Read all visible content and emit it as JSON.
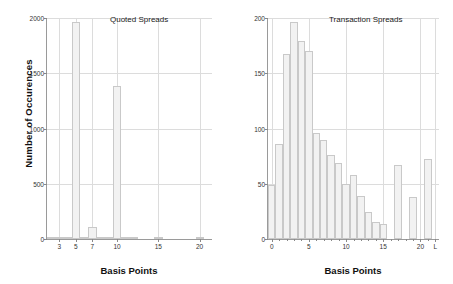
{
  "chart_data": [
    {
      "type": "bar",
      "title": "Quoted Spreads",
      "xlabel": "Basis Points",
      "ylabel": "Number of Occurences",
      "ylim": [
        0,
        2000
      ],
      "xlim": [
        1.5,
        21.5
      ],
      "yticks": [
        0,
        500,
        1000,
        1500,
        2000
      ],
      "ytick_labels": [
        "0",
        "500",
        "1000",
        "1500",
        "2000"
      ],
      "xticks": [
        3,
        5,
        7,
        10,
        15,
        20
      ],
      "xtick_labels": [
        "3",
        "5",
        "7",
        "10",
        "15",
        "20"
      ],
      "grid": true,
      "categories": [
        2,
        3,
        4,
        5,
        6,
        7,
        8,
        9,
        10,
        11,
        12,
        15,
        20
      ],
      "values": [
        8,
        22,
        20,
        1965,
        18,
        105,
        6,
        4,
        1385,
        3,
        2,
        18,
        10
      ],
      "bar_width": 1
    },
    {
      "type": "bar",
      "title": "Transaction Spreads",
      "xlabel": "Basis Points",
      "ylabel": "",
      "ylim": [
        0,
        200
      ],
      "xlim": [
        -0.5,
        22.5
      ],
      "yticks": [
        0,
        50,
        100,
        150,
        200
      ],
      "ytick_labels": [
        "0",
        "50",
        "100",
        "150",
        "200"
      ],
      "xticks": [
        0,
        5,
        10,
        15,
        20,
        22
      ],
      "xtick_labels": [
        "0",
        "5",
        "10",
        "15",
        "20",
        "L"
      ],
      "grid": true,
      "categories": [
        0,
        1,
        2,
        3,
        4,
        5,
        6,
        7,
        8,
        9,
        10,
        11,
        12,
        13,
        14,
        15,
        16,
        17,
        18,
        19,
        20,
        21,
        22
      ],
      "values": [
        49,
        86,
        167,
        196,
        179,
        170,
        96,
        90,
        76,
        69,
        50,
        58,
        39,
        24,
        15,
        14,
        0,
        67,
        0,
        38,
        0,
        72,
        0
      ],
      "bar_width": 1
    }
  ],
  "colors": {
    "bar_fill": "#f2f2f2",
    "bar_edge": "#c9c9c9",
    "grid": "#dcdcdc",
    "axis": "#9a9a9a",
    "text": "#111111",
    "background": "#ffffff"
  }
}
